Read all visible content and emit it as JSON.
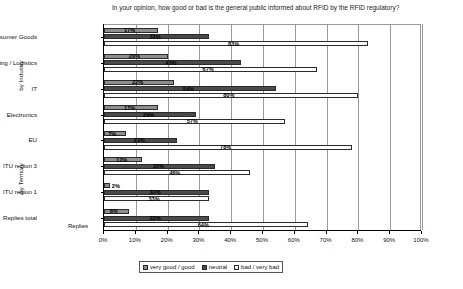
{
  "chart_data": {
    "type": "bar",
    "orientation": "horizontal",
    "title": "In your opinion, how good or bad is the general public informed about RFID by the RFID regulatory?",
    "xlabel": "Replies",
    "ylabel": "",
    "xlim": [
      0,
      100
    ],
    "xticks": [
      "0%",
      "10%",
      "20%",
      "30%",
      "40%",
      "50%",
      "60%",
      "70%",
      "80%",
      "90%",
      "100%"
    ],
    "grid": true,
    "legend_position": "bottom",
    "categories": [
      "Retail / Consumer Goods",
      "Packaging / Logistics",
      "IT",
      "Electronics",
      "EU",
      "ITU region 3",
      "ITU region 1",
      "Replies total"
    ],
    "group_labels": [
      {
        "label": "by Industry",
        "categories": [
          "Retail / Consumer Goods",
          "Packaging / Logistics",
          "IT",
          "Electronics"
        ]
      },
      {
        "label": "by Territory",
        "categories": [
          "EU",
          "ITU region 3",
          "ITU region 1",
          "Replies total"
        ]
      }
    ],
    "series": [
      {
        "name": "very good / good",
        "color": "#8e8e8e",
        "values": [
          17,
          20,
          22,
          17,
          12,
          8,
          9,
          7
        ]
      },
      {
        "name": "neutral",
        "color": "#4a4a4a",
        "values": [
          33,
          43,
          54,
          29,
          35,
          33,
          31,
          30
        ]
      },
      {
        "name": "bad / very bad",
        "color": "#ffffff",
        "values": [
          83,
          67,
          80,
          57,
          78,
          46,
          33,
          64
        ]
      }
    ],
    "bars": [
      {
        "category": "Retail / Consumer Goods",
        "values": [
          {
            "series": "very good / good",
            "value": 17,
            "label": "17%"
          },
          {
            "series": "neutral",
            "value": 33,
            "label": "33%"
          },
          {
            "series": "bad / very bad",
            "value": 83,
            "label": "83%"
          }
        ]
      },
      {
        "category": "Packaging / Logistics",
        "values": [
          {
            "series": "very good / good",
            "value": 20,
            "label": "20%"
          },
          {
            "series": "neutral",
            "value": 43,
            "label": "43%"
          },
          {
            "series": "bad / very bad",
            "value": 67,
            "label": "67%"
          }
        ]
      },
      {
        "category": "IT",
        "values": [
          {
            "series": "very good / good",
            "value": 22,
            "label": "22%"
          },
          {
            "series": "neutral",
            "value": 54,
            "label": "54%"
          },
          {
            "series": "bad / very bad",
            "value": 80,
            "label": "80%"
          }
        ]
      },
      {
        "category": "Electronics",
        "values": [
          {
            "series": "very good / good",
            "value": 17,
            "label": "17%"
          },
          {
            "series": "neutral",
            "value": 29,
            "label": "29%"
          },
          {
            "series": "bad / very bad",
            "value": 57,
            "label": "57%"
          }
        ]
      },
      {
        "category": "EU",
        "values": [
          {
            "series": "very good / good",
            "value": 7,
            "label": "7%"
          },
          {
            "series": "neutral",
            "value": 23,
            "label": "23%"
          },
          {
            "series": "bad / very bad",
            "value": 78,
            "label": "78%"
          }
        ]
      },
      {
        "category": "ITU region 3",
        "values": [
          {
            "series": "very good / good",
            "value": 12,
            "label": "12%"
          },
          {
            "series": "neutral",
            "value": 35,
            "label": "35%"
          },
          {
            "series": "bad / very bad",
            "value": 46,
            "label": "46%"
          }
        ]
      },
      {
        "category": "ITU region 1",
        "values": [
          {
            "series": "very good / good",
            "value": 2,
            "label": "2%"
          },
          {
            "series": "neutral",
            "value": 33,
            "label": "33%"
          },
          {
            "series": "bad / very bad",
            "value": 33,
            "label": "33%"
          }
        ]
      },
      {
        "category": "Replies total",
        "values": [
          {
            "series": "very good / good",
            "value": 8,
            "label": "8%"
          },
          {
            "series": "neutral",
            "value": 33,
            "label": "33%"
          },
          {
            "series": "bad / very bad",
            "value": 64,
            "label": "64%"
          }
        ]
      }
    ],
    "rows": [
      {
        "label": "17%",
        "value": 17,
        "series": 0
      },
      {
        "label": "83%",
        "value": 83,
        "series": 2
      },
      {
        "label": "33%",
        "value": 33,
        "series": 1
      },
      {
        "label": "67%",
        "value": 67,
        "series": 2
      },
      {
        "label": "20%",
        "value": 20,
        "series": 0
      },
      {
        "label": "80%",
        "value": 80,
        "series": 2
      },
      {
        "label": "43%",
        "value": 43,
        "series": 1
      },
      {
        "label": "57%",
        "value": 57,
        "series": 2
      },
      {
        "label": "22%",
        "value": 22,
        "series": 0
      },
      {
        "label": "78%",
        "value": 78,
        "series": 2
      },
      {
        "label": "54%",
        "value": 54,
        "series": 1
      },
      {
        "label": "46%",
        "value": 46,
        "series": 2
      },
      {
        "label": "17%",
        "value": 17,
        "series": 0
      },
      {
        "label": "64%",
        "value": 64,
        "series": 2
      },
      {
        "label": "33%",
        "value": 33,
        "series": 1
      },
      {
        "label": "7%",
        "value": 7,
        "series": 0
      },
      {
        "label": "29%",
        "value": 29,
        "series": 1
      },
      {
        "label": "64%",
        "value": 64,
        "series": 2
      },
      {
        "label": "23%",
        "value": 23,
        "series": 0
      },
      {
        "label": "23%",
        "value": 23,
        "series": 1
      },
      {
        "label": "55%",
        "value": 55,
        "series": 2
      },
      {
        "label": "12%",
        "value": 12,
        "series": 0
      },
      {
        "label": "35%",
        "value": 35,
        "series": 1
      },
      {
        "label": "54%",
        "value": 54,
        "series": 2
      },
      {
        "label": "2%",
        "value": 2,
        "series": 0
      },
      {
        "label": "33%",
        "value": 33,
        "series": 1
      },
      {
        "label": "65%",
        "value": 65,
        "series": 2
      },
      {
        "label": "8%",
        "value": 8,
        "series": 0
      },
      {
        "label": "33%",
        "value": 33,
        "series": 1
      },
      {
        "label": "59%",
        "value": 59,
        "series": 2
      },
      {
        "label": "7%",
        "value": 7,
        "series": 0
      },
      {
        "label": "29%",
        "value": 29,
        "series": 1
      },
      {
        "label": "64%",
        "value": 64,
        "series": 2
      },
      {
        "label": "9%",
        "value": 9,
        "series": 0
      },
      {
        "label": "31%",
        "value": 31,
        "series": 1
      },
      {
        "label": "59%",
        "value": 59,
        "series": 2
      },
      {
        "label": "5%",
        "value": 5,
        "series": 0
      },
      {
        "label": "30%",
        "value": 30,
        "series": 1
      },
      {
        "label": "64%",
        "value": 64,
        "series": 2
      },
      {
        "label": "7%",
        "value": 7,
        "series": 0
      },
      {
        "label": "30%",
        "value": 30,
        "series": 1
      },
      {
        "label": "63%",
        "value": 63,
        "series": 2
      }
    ]
  },
  "legend": {
    "items": [
      {
        "label": "very good / good",
        "color": "#8e8e8e"
      },
      {
        "label": "neutral",
        "color": "#4a4a4a"
      },
      {
        "label": "bad / very bad",
        "color": "#ffffff"
      }
    ]
  }
}
